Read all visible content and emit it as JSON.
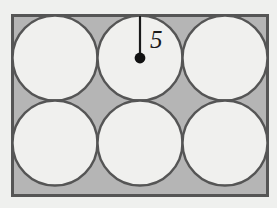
{
  "figure": {
    "type": "geometry-diagram",
    "background_color": "#eff0ee",
    "rectangle": {
      "name": "bounding-rectangle",
      "x": 12.5,
      "y": 15.5,
      "width": 255,
      "height": 180,
      "fill_color": "#b5b5b5",
      "stroke_color": "#555555",
      "stroke_width": 3
    },
    "circles": {
      "count": 6,
      "rows": 2,
      "columns": 3,
      "radius": 42.5,
      "diameter": 85,
      "fill_color": "#f0f0ee",
      "stroke_color": "#555555",
      "stroke_width": 2.4,
      "centers": [
        {
          "label": "top-left",
          "cx": 55,
          "cy": 58
        },
        {
          "label": "top-middle",
          "cx": 140,
          "cy": 58
        },
        {
          "label": "top-right",
          "cx": 225,
          "cy": 58
        },
        {
          "label": "bottom-left",
          "cx": 55,
          "cy": 143
        },
        {
          "label": "bottom-middle",
          "cx": 140,
          "cy": 143
        },
        {
          "label": "bottom-right",
          "cx": 225,
          "cy": 143
        }
      ]
    },
    "radius_marker": {
      "name": "radius-segment",
      "value": "5",
      "from_x": 140,
      "from_y": 16,
      "to_x": 140,
      "to_y": 58,
      "line_color": "#1a1a1a",
      "line_width": 2.2,
      "dot_color": "#111111",
      "dot_radius": 5.4,
      "label_x": 150,
      "label_y": 48
    }
  }
}
